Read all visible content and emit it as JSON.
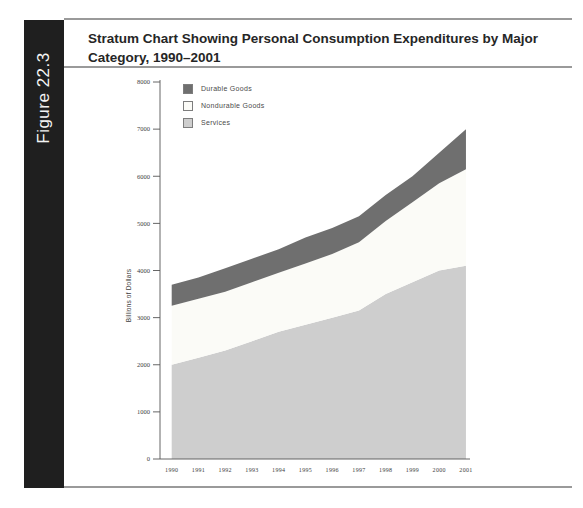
{
  "figure_label": "Figure 22.3",
  "title_lines": [
    "Stratum Chart Showing Personal Consumption Expenditures by Major",
    "Category, 1990–2001"
  ],
  "colors": {
    "sidebar": "#1f1f1f",
    "rule": "#9a9a9a",
    "durable": "#6f6f6f",
    "nondurable": "#fbfbf7",
    "services": "#cecece",
    "axis": "#555555"
  },
  "chart_data": {
    "type": "area",
    "stacked": true,
    "title": "Stratum Chart Showing Personal Consumption Expenditures by Major Category, 1990–2001",
    "x": [
      1990,
      1991,
      1992,
      1993,
      1994,
      1995,
      1996,
      1997,
      1998,
      1999,
      2000,
      2001
    ],
    "x_labels": [
      "1990",
      "1991",
      "1992",
      "1993",
      "1994",
      "1995",
      "1996",
      "1997",
      "1998",
      "1999",
      "2000",
      "2001"
    ],
    "series": [
      {
        "name": "Durable Goods",
        "color": "#6f6f6f",
        "values": [
          450,
          450,
          500,
          500,
          500,
          550,
          550,
          550,
          550,
          550,
          650,
          850
        ]
      },
      {
        "name": "Nondurable Goods",
        "color": "#fbfbf7",
        "values": [
          1250,
          1250,
          1250,
          1250,
          1250,
          1300,
          1350,
          1450,
          1550,
          1700,
          1850,
          2050
        ]
      },
      {
        "name": "Services",
        "color": "#cecece",
        "values": [
          2000,
          2150,
          2300,
          2500,
          2700,
          2850,
          3000,
          3150,
          3500,
          3750,
          4000,
          4100
        ]
      }
    ],
    "stack_totals": [
      3700,
      3850,
      4050,
      4250,
      4450,
      4700,
      4900,
      5150,
      5600,
      6000,
      6500,
      7000
    ],
    "xlabel": "",
    "ylabel": "Billions of Dollars",
    "ylim": [
      0,
      8000
    ],
    "ytick_interval": 1000,
    "ytick_labels": [
      "0",
      "1000",
      "2000",
      "3000",
      "4000",
      "5000",
      "6000",
      "7000",
      "8000"
    ],
    "grid": false,
    "legend_position": "top-left",
    "legend_order": [
      "Durable Goods",
      "Nondurable Goods",
      "Services"
    ]
  }
}
